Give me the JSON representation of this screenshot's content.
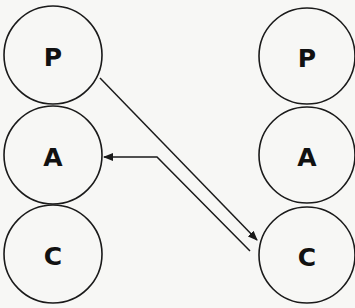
{
  "diagram": {
    "type": "transactional-analysis-ego-states",
    "left_person": {
      "states": [
        {
          "label": "P",
          "cx": 53,
          "cy": 55,
          "r": 49
        },
        {
          "label": "A",
          "cx": 53,
          "cy": 155,
          "r": 49
        },
        {
          "label": "C",
          "cx": 53,
          "cy": 254,
          "r": 49
        }
      ]
    },
    "right_person": {
      "states": [
        {
          "label": "P",
          "cx": 307,
          "cy": 56,
          "r": 48
        },
        {
          "label": "A",
          "cx": 307,
          "cy": 155,
          "r": 48
        },
        {
          "label": "C",
          "cx": 307,
          "cy": 255,
          "r": 48
        }
      ]
    },
    "transactions": [
      {
        "from": "left.P",
        "to": "right.C",
        "direction": "left-to-right"
      },
      {
        "from": "right.C",
        "to": "left.A",
        "direction": "right-to-left"
      }
    ],
    "colors": {
      "stroke": "#1a1a1a",
      "background": "#f7f7f5",
      "text": "#111111"
    }
  }
}
